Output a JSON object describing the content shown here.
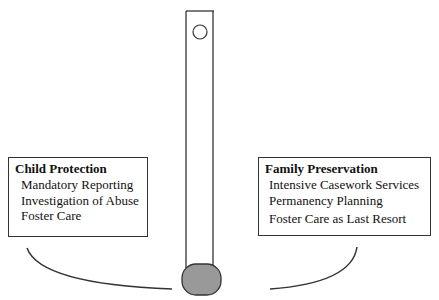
{
  "diagram": {
    "left_box": {
      "title": "Child Protection",
      "items": [
        "Mandatory Reporting",
        "Investigation of Abuse",
        "Foster Care"
      ]
    },
    "right_box": {
      "title": "Family Preservation",
      "items": [
        "Intensive Casework Services",
        "Permanency Planning",
        "Foster Care as Last Resort"
      ]
    },
    "colors": {
      "line": "#333333",
      "weight_fill": "#999999"
    }
  }
}
